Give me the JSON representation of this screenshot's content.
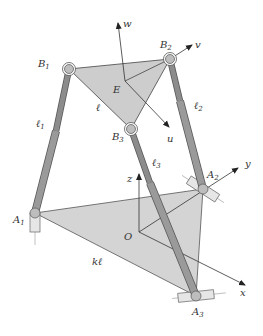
{
  "diagram": {
    "colors": {
      "platform_fill": "#cdcdcd",
      "base_fill": "#d4d4d4",
      "leg_upper": "#8c8c8c",
      "leg_lower": "#9a9a9a",
      "leg_edge": "#555555",
      "line": "#333333",
      "joint_fill": "#bdbdbd",
      "slider_fill": "#e6e6e6"
    },
    "points": {
      "B1": {
        "x": 69,
        "y": 69
      },
      "B2": {
        "x": 170,
        "y": 59
      },
      "B3": {
        "x": 131,
        "y": 129
      },
      "E": {
        "x": 125,
        "y": 81
      },
      "A1": {
        "x": 35,
        "y": 213
      },
      "A2": {
        "x": 203,
        "y": 189
      },
      "A3": {
        "x": 196,
        "y": 296
      },
      "O": {
        "x": 139,
        "y": 232
      }
    },
    "labels": {
      "B1": {
        "text": "B",
        "sub": "1",
        "x": 38,
        "y": 67
      },
      "B2": {
        "text": "B",
        "sub": "2",
        "x": 160,
        "y": 48
      },
      "B3": {
        "text": "B",
        "sub": "3",
        "x": 112,
        "y": 140
      },
      "E": {
        "text": "E",
        "x": 113,
        "y": 93
      },
      "w": {
        "text": "w",
        "x": 123,
        "y": 27
      },
      "v": {
        "text": "v",
        "x": 195,
        "y": 48
      },
      "u": {
        "text": "u",
        "x": 167,
        "y": 142
      },
      "l_platform": {
        "text": "ℓ",
        "x": 96,
        "y": 111
      },
      "l1": {
        "text": "ℓ",
        "sub": "1",
        "x": 36,
        "y": 127
      },
      "l2": {
        "text": "ℓ",
        "sub": "2",
        "x": 194,
        "y": 109
      },
      "l3": {
        "text": "ℓ",
        "sub": "3",
        "x": 152,
        "y": 166
      },
      "A1": {
        "text": "A",
        "sub": "1",
        "x": 13,
        "y": 223
      },
      "A2": {
        "text": "A",
        "sub": "2",
        "x": 207,
        "y": 178
      },
      "A3": {
        "text": "A",
        "sub": "3",
        "x": 192,
        "y": 315
      },
      "O": {
        "text": "O",
        "x": 124,
        "y": 240
      },
      "z": {
        "text": "z",
        "x": 127,
        "y": 182
      },
      "y": {
        "text": "y",
        "x": 245,
        "y": 167
      },
      "x": {
        "text": "x",
        "x": 240,
        "y": 296
      },
      "kl": {
        "text": "kℓ",
        "x": 92,
        "y": 265
      }
    }
  }
}
